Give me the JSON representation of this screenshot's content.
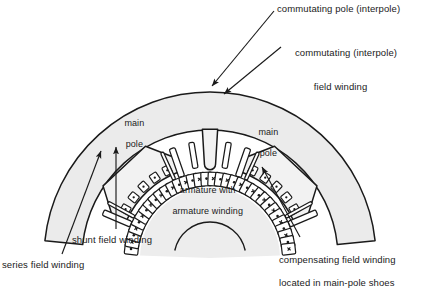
{
  "figure": {
    "kind": "dc-machine-cross-section",
    "view": "partial cross-section of a DC machine stator and armature",
    "colors": {
      "frame_fill": "#ebebeb",
      "pole_fill": "#f2f2f2",
      "armature_fill": "#ededed",
      "line": "#1a1a1a",
      "background": "#ffffff",
      "text": "#1a1a1a"
    }
  },
  "callouts": {
    "commutating_pole": {
      "text": "commutating pole (interpole)",
      "x": 277,
      "y": 3,
      "align": "left"
    },
    "commutating_field_winding": {
      "line1": "commutating (interpole)",
      "line2": "field winding",
      "x": 284,
      "y": 36,
      "align": "left"
    },
    "series_field_winding": {
      "text": "series field winding",
      "x": 2,
      "y": 259,
      "align": "left"
    },
    "shunt_field_winding": {
      "text": "shunt field winding",
      "x": 72,
      "y": 234,
      "align": "left"
    },
    "compensating_field_winding": {
      "line1": "compensating field winding",
      "line2": "located in main-pole shoes",
      "x": 268,
      "y": 243,
      "align": "left"
    }
  },
  "inner_labels": {
    "main_pole_left": {
      "line1": "main",
      "line2": "pole",
      "x": 114,
      "y": 108
    },
    "main_pole_right": {
      "line1": "main",
      "line2": "pole",
      "x": 248,
      "y": 117
    },
    "armature": {
      "line1": "armature with",
      "line2": "armature winding",
      "x": 162,
      "y": 175
    }
  },
  "leaders": [
    {
      "name": "leader-commutating-pole",
      "path": "M 274 11 L 212 86",
      "arrow_at": [
        212,
        86
      ],
      "angle": 230.4
    },
    {
      "name": "leader-commutating-field-winding",
      "path": "M 281 47 L 224 94",
      "arrow_at": [
        224,
        94
      ],
      "angle": 219.5
    },
    {
      "name": "leader-series-field-winding",
      "path": "M 62 254 L 101 151",
      "arrow_at": [
        101,
        151
      ],
      "angle": 290.7
    },
    {
      "name": "leader-shunt-field-winding",
      "path": "M 116 229 L 116 147",
      "arrow_at": [
        116,
        147
      ],
      "angle": 270
    },
    {
      "name": "leader-compensating-field-winding",
      "path": "M 300 237 L 262 167",
      "arrow_at": [
        262,
        167
      ],
      "angle": 241.5
    }
  ],
  "geometry": {
    "center": {
      "x": 210,
      "y": 258
    },
    "frame_outer_radius": 166,
    "frame_inner_radius": 128,
    "armature_radius": 88,
    "armature_core_radius": 70,
    "shaft_radius": 36,
    "pole_span_deg": 46,
    "main_poles": [
      {
        "name": "main-pole-left",
        "center_angle_deg": 227
      },
      {
        "name": "main-pole-right",
        "center_angle_deg": 313
      }
    ],
    "interpoles": [
      {
        "name": "interpole-top",
        "center_angle_deg": 270
      }
    ],
    "armature_slot_count": 34,
    "armature_slot_symbols": [
      "dot",
      "cross"
    ],
    "compensating_slots_per_pole": 5,
    "field_coil_bars": [
      {
        "name": "series-coil-bar",
        "width": 3.2
      },
      {
        "name": "shunt-coil-bar",
        "width": 6.0
      }
    ]
  }
}
